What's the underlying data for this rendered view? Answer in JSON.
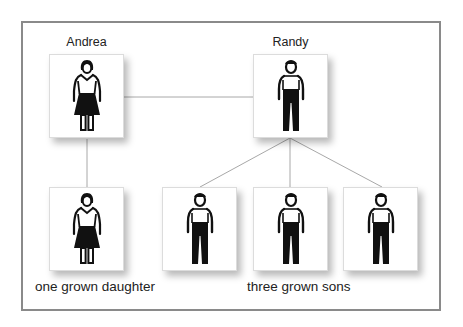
{
  "diagram": {
    "type": "family-tree",
    "parents": [
      {
        "id": "andrea",
        "name": "Andrea",
        "gender": "female",
        "icon": "woman-icon"
      },
      {
        "id": "randy",
        "name": "Randy",
        "gender": "male",
        "icon": "man-icon"
      }
    ],
    "children": [
      {
        "id": "daughter-1",
        "gender": "female",
        "icon": "woman-icon",
        "parent": "andrea"
      },
      {
        "id": "son-1",
        "gender": "male",
        "icon": "man-icon",
        "parent": "randy"
      },
      {
        "id": "son-2",
        "gender": "male",
        "icon": "man-icon",
        "parent": "randy"
      },
      {
        "id": "son-3",
        "gender": "male",
        "icon": "man-icon",
        "parent": "randy"
      }
    ],
    "group_labels": {
      "daughters": "one grown daughter",
      "sons": "three grown sons"
    },
    "colors": {
      "frame": "#8a8a8a",
      "connector": "#a8a8a8",
      "figure": "#111111",
      "text": "#222222",
      "box_bg": "#ffffff"
    }
  }
}
